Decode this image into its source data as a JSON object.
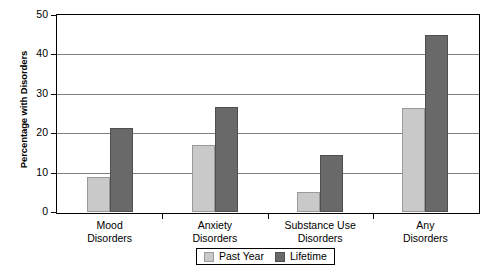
{
  "chart_data": {
    "type": "bar",
    "title": "",
    "xlabel": "",
    "ylabel": "Percentage with Disorders",
    "ylim": [
      0,
      50
    ],
    "yticks": [
      0,
      10,
      20,
      30,
      40,
      50
    ],
    "ytick_labels": [
      "0",
      "10",
      "20",
      "30",
      "40",
      "50"
    ],
    "grid": true,
    "legend_position": "bottom-center",
    "categories": [
      "Mood Disorders",
      "Anxiety Disorders",
      "Substance Use Disorders",
      "Any Disorders"
    ],
    "category_lines": [
      {
        "line1": "Mood",
        "line2": "Disorders"
      },
      {
        "line1": "Anxiety",
        "line2": "Disorders"
      },
      {
        "line1": "Substance Use",
        "line2": "Disorders"
      },
      {
        "line1": "Any",
        "line2": "Disorders"
      }
    ],
    "series": [
      {
        "name": "Past Year",
        "color": "#c9c9c9",
        "values": [
          8.9,
          16.9,
          5.0,
          26.5
        ]
      },
      {
        "name": "Lifetime",
        "color": "#696969",
        "values": [
          21.2,
          26.7,
          14.4,
          45.0
        ]
      }
    ]
  },
  "legend": {
    "items": [
      {
        "label": "Past Year",
        "swatch": "past"
      },
      {
        "label": "Lifetime",
        "swatch": "life"
      }
    ]
  }
}
